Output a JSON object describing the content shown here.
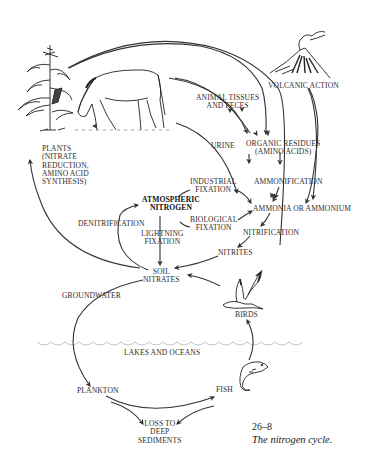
{
  "figure": {
    "number": "26–8",
    "caption": "The nitrogen cycle."
  },
  "labels": {
    "plants": "PLANTS\n(NITRATE\nREDUCTION,\nAMINO ACID\nSYNTHESIS)",
    "animal_tissues": "ANIMAL TISSUES\nAND FECES",
    "volcanic_action": "VOLCANIC ACTION",
    "urine": "URINE",
    "organic_residues": "ORGANIC RESIDUES\n(AMINO ACIDS)",
    "ammonification": "AMMONIFICATION",
    "industrial_fixation": "INDUSTRIAL\nFIXATION",
    "atmospheric_nitrogen": "ATMOSPHERIC\nNITROGEN",
    "biological_fixation": "BIOLOGICAL\nFIXATION",
    "ammonia": "AMMONIA OR AMMONIUM",
    "denitrification": "DENITRIFICATION",
    "lightning_fixation": "LIGHTNING\nFIXATION",
    "nitrification": "NITRIFICATION",
    "nitrites": "NITRITES",
    "soil_nitrates": "SOIL\nNITRATES",
    "groundwater": "GROUNDWATER",
    "birds": "BIRDS",
    "lakes_oceans": "LAKES AND OCEANS",
    "plankton": "PLANKTON",
    "fish": "FISH",
    "loss_sediments": "LOSS TO\nDEEP\nSEDIMENTS"
  },
  "illustrations": [
    "corn-plant",
    "horse",
    "volcano",
    "bird",
    "fish",
    "water-surface"
  ],
  "colors": {
    "ink": "#2e2e2e",
    "water_line": "#bdbdbd",
    "background": "#ffffff"
  }
}
